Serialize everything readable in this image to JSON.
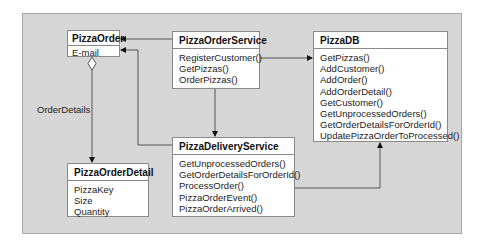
{
  "diagram": {
    "classes": {
      "pizza_order": {
        "name": "PizzaOrder",
        "members": [
          "E-mail"
        ]
      },
      "pizza_order_service": {
        "name": "PizzaOrderService",
        "members": [
          "RegisterCustomer()",
          "GetPizzas()",
          "OrderPizzas()"
        ]
      },
      "pizza_db": {
        "name": "PizzaDB",
        "members": [
          "GetPizzas()",
          "AddCustomer()",
          "AddOrder()",
          "AddOrderDetail()",
          "GetCustomer()",
          "GetUnprocessedOrders()",
          "GetOrderDetailsForOrderId()",
          "UpdatePizzaOrderToProcessed()"
        ]
      },
      "pizza_delivery_service": {
        "name": "PizzaDeliveryService",
        "members": [
          "GetUnprocessedOrders()",
          "GetOrderDetailsForOrderId()",
          "ProcessOrder()",
          "PizzaOrderEvent()",
          "PizzaOrderArrived()"
        ]
      },
      "pizza_order_detail": {
        "name": "PizzaOrderDetail",
        "members": [
          "PizzaKey",
          "Size",
          "Quantity"
        ]
      }
    },
    "labels": {
      "order_details": "OrderDetails"
    },
    "relationships": [
      {
        "from": "PizzaOrderService",
        "to": "PizzaOrder",
        "type": "association-arrow"
      },
      {
        "from": "PizzaDeliveryService",
        "to": "PizzaOrder",
        "type": "association-arrow"
      },
      {
        "from": "PizzaOrderService",
        "to": "PizzaDB",
        "type": "association-arrow"
      },
      {
        "from": "PizzaOrderService",
        "to": "PizzaDeliveryService",
        "type": "association-arrow"
      },
      {
        "from": "PizzaDeliveryService",
        "to": "PizzaDB",
        "type": "association-arrow"
      },
      {
        "from": "PizzaOrder",
        "to": "PizzaOrderDetail",
        "type": "aggregation",
        "label": "OrderDetails"
      }
    ],
    "colors": {
      "background": "#d6d6d6",
      "box": "#ffffff",
      "line": "#555555"
    }
  }
}
